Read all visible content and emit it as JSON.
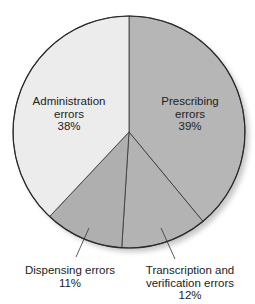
{
  "chart_data": {
    "type": "pie",
    "title": "",
    "start_angle_deg": 0,
    "direction": "clockwise",
    "slices": [
      {
        "name": "Prescribing errors",
        "label_lines": [
          "Prescribing",
          "errors",
          "39%"
        ],
        "value": 39,
        "color": "#b6b6b6"
      },
      {
        "name": "Transcription and verification errors",
        "label_lines": [
          "Transcription and",
          "verification errors",
          "12%"
        ],
        "value": 12,
        "color": "#b3b3b3"
      },
      {
        "name": "Dispensing errors",
        "label_lines": [
          "Dispensing errors",
          "11%"
        ],
        "value": 11,
        "color": "#afafaf"
      },
      {
        "name": "Administration errors",
        "label_lines": [
          "Administration",
          "errors",
          "38%"
        ],
        "value": 38,
        "color": "#ececec"
      }
    ],
    "categories": [
      "Prescribing errors",
      "Transcription and verification errors",
      "Dispensing errors",
      "Administration errors"
    ],
    "values": [
      39,
      12,
      11,
      38
    ],
    "units": "%",
    "legend": "none (labels on/near slices)",
    "colors": {
      "outline": "#2a2a2a",
      "shadow": "#d4d4d4",
      "background": "#ffffff"
    }
  }
}
